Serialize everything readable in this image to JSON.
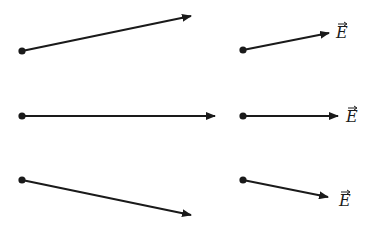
{
  "diagram": {
    "stroke_color": "#1a1a1a",
    "background": "#ffffff",
    "rows": [
      {
        "left": {
          "x1": 22,
          "y1": 51,
          "x2": 191,
          "y2": 16
        },
        "right": {
          "x1": 243,
          "y1": 50,
          "x2": 329,
          "y2": 33,
          "label": "E",
          "label_x": 336,
          "label_y": 38
        }
      },
      {
        "left": {
          "x1": 22,
          "y1": 116,
          "x2": 215,
          "y2": 116
        },
        "right": {
          "x1": 243,
          "y1": 116,
          "x2": 338,
          "y2": 116,
          "label": "E",
          "label_x": 346,
          "label_y": 122
        }
      },
      {
        "left": {
          "x1": 22,
          "y1": 180,
          "x2": 191,
          "y2": 215
        },
        "right": {
          "x1": 243,
          "y1": 180,
          "x2": 328,
          "y2": 197,
          "label": "E",
          "label_x": 339,
          "label_y": 206
        }
      }
    ]
  }
}
